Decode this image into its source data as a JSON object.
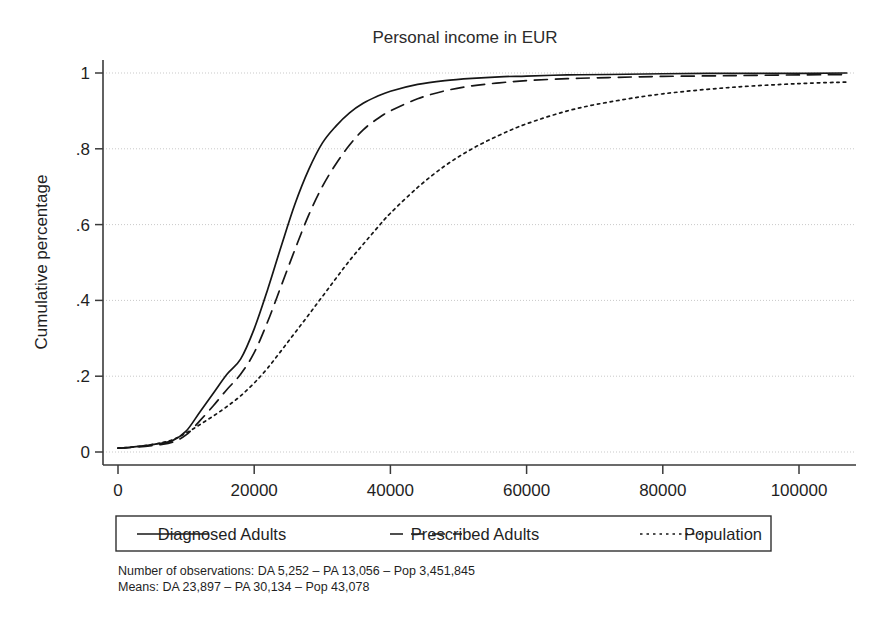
{
  "chart_data": {
    "type": "line",
    "title": "Personal income in EUR",
    "xlabel": "",
    "ylabel": "Cumulative percentage",
    "xlim": [
      0,
      108000
    ],
    "ylim": [
      0,
      1.04
    ],
    "grid": true,
    "legend_position": "below-axes",
    "x_ticks": [
      0,
      20000,
      40000,
      60000,
      80000,
      100000
    ],
    "x_tick_labels": [
      "0",
      "20000",
      "40000",
      "60000",
      "80000",
      "100000"
    ],
    "y_ticks": [
      0,
      0.2,
      0.4,
      0.6,
      0.8,
      1
    ],
    "y_tick_labels": [
      "0",
      ".2",
      ".4",
      ".6",
      ".8",
      "1"
    ],
    "x": [
      0,
      2000,
      4000,
      6000,
      8000,
      10000,
      12000,
      14000,
      16000,
      18000,
      20000,
      22000,
      24000,
      26000,
      28000,
      30000,
      32000,
      34000,
      36000,
      38000,
      40000,
      44000,
      48000,
      52000,
      56000,
      60000,
      66000,
      72000,
      80000,
      90000,
      100000,
      107000
    ],
    "series": [
      {
        "name": "Diagnosed Adults",
        "style": "solid",
        "values": [
          0.01,
          0.013,
          0.017,
          0.022,
          0.03,
          0.055,
          0.105,
          0.155,
          0.205,
          0.245,
          0.325,
          0.43,
          0.545,
          0.655,
          0.745,
          0.815,
          0.86,
          0.895,
          0.92,
          0.938,
          0.952,
          0.97,
          0.98,
          0.986,
          0.99,
          0.992,
          0.995,
          0.996,
          0.998,
          0.999,
          0.999,
          1.0
        ]
      },
      {
        "name": "Prescribed Adults",
        "style": "dashed",
        "values": [
          0.01,
          0.012,
          0.015,
          0.019,
          0.026,
          0.045,
          0.082,
          0.122,
          0.165,
          0.205,
          0.262,
          0.345,
          0.44,
          0.535,
          0.625,
          0.7,
          0.76,
          0.81,
          0.85,
          0.878,
          0.9,
          0.932,
          0.953,
          0.966,
          0.974,
          0.98,
          0.985,
          0.988,
          0.991,
          0.993,
          0.995,
          0.996
        ]
      },
      {
        "name": "Population",
        "style": "dotted",
        "values": [
          0.01,
          0.013,
          0.017,
          0.023,
          0.032,
          0.05,
          0.072,
          0.095,
          0.12,
          0.148,
          0.182,
          0.222,
          0.268,
          0.315,
          0.362,
          0.41,
          0.458,
          0.505,
          0.548,
          0.59,
          0.63,
          0.698,
          0.755,
          0.8,
          0.836,
          0.866,
          0.9,
          0.923,
          0.945,
          0.962,
          0.972,
          0.976
        ]
      }
    ],
    "notes": [
      "Number of observations: DA 5,252 – PA 13,056 – Pop 3,451,845",
      "Means: DA 23,897 – PA 30,134 – Pop 43,078"
    ]
  }
}
